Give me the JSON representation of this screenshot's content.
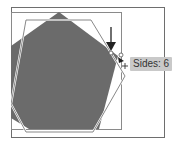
{
  "canvas": {
    "background": "#ffffff",
    "frame_color": "#6e6e6e",
    "shape_fill": "#6b6b6b",
    "outline_color": "#7a7a7a"
  },
  "pentagon": {
    "fill": "#6b6b6b",
    "points": "59,12 118,56 99,129 29,129 11,118 11,46"
  },
  "hexagon_preview": {
    "stroke": "#7a7a7a",
    "points": "26,20 91,20 125,76 93,132 26,132 11,104"
  },
  "artboard_box": {
    "x": 11,
    "y": 12,
    "width": 110,
    "height": 117
  },
  "outer_frame": {
    "x": 11,
    "y": 7,
    "width": 153,
    "height": 130
  },
  "arrow": {
    "x": 111,
    "y1": 27,
    "y2": 50,
    "color": "#333333"
  },
  "cursor": {
    "x": 125,
    "y": 66,
    "glyph": "+"
  },
  "tooltip": {
    "label": "Sides: 6",
    "background": "#c9c9c9"
  }
}
